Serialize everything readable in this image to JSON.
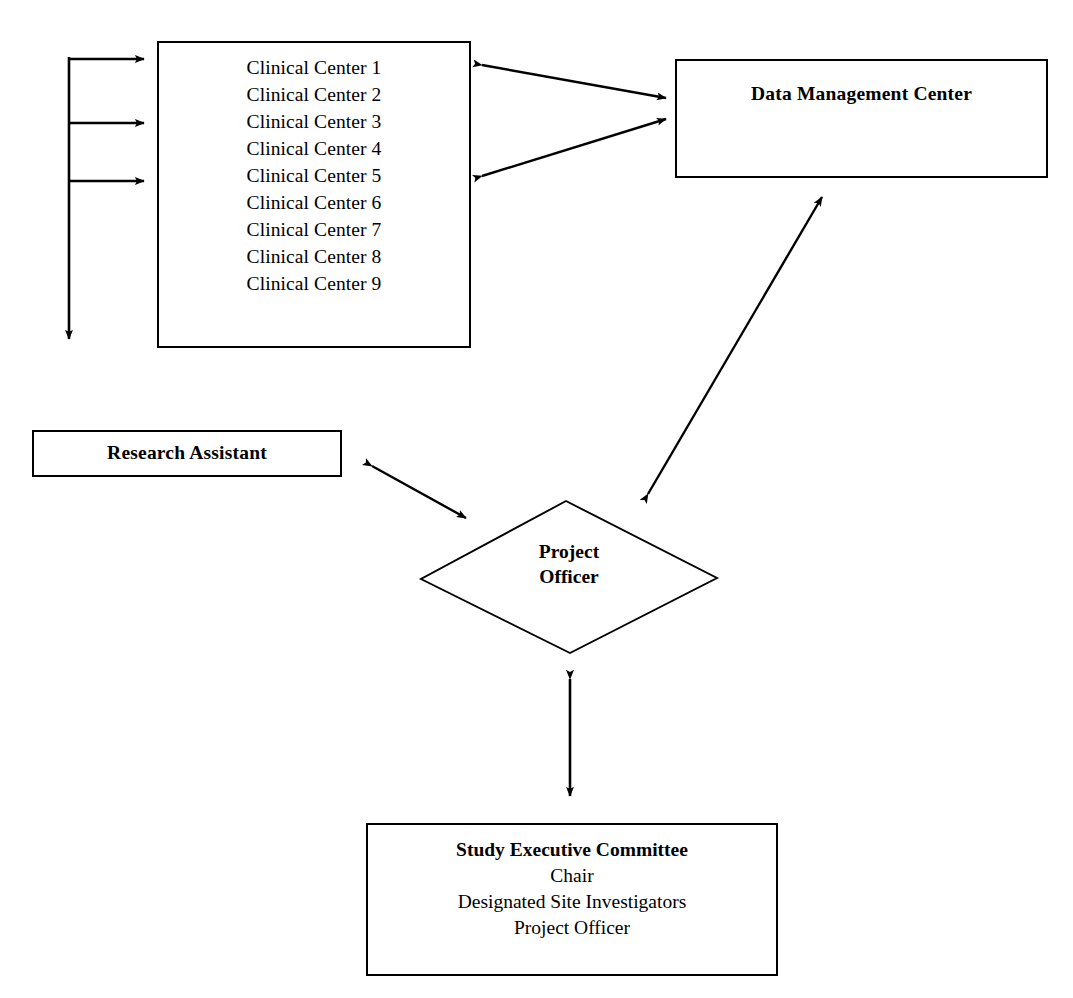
{
  "diagram": {
    "type": "organizational-flow-diagram",
    "line_color": "#000000",
    "background_color": "#ffffff"
  },
  "nodes": {
    "clinical_centers": {
      "shape": "rectangle",
      "items": [
        "Clinical Center 1",
        "Clinical Center 2",
        "Clinical Center 3",
        "Clinical Center 4",
        "Clinical Center 5",
        "Clinical Center 6",
        "Clinical Center 7",
        "Clinical Center 8",
        "Clinical Center 9"
      ]
    },
    "data_management_center": {
      "shape": "rectangle",
      "label": "Data Management Center"
    },
    "research_assistant": {
      "shape": "rectangle",
      "label": "Research Assistant"
    },
    "project_officer": {
      "shape": "diamond",
      "label_line1": "Project",
      "label_line2": "Officer"
    },
    "study_executive_committee": {
      "shape": "rectangle",
      "title": "Study Executive Committee",
      "members": [
        "Chair",
        "Designated Site Investigators",
        "Project Officer"
      ]
    }
  },
  "connectors": [
    {
      "name": "feeder-spine-to-clinical-centers-1",
      "style": "single-arrow",
      "direction": "right"
    },
    {
      "name": "feeder-spine-to-clinical-centers-2",
      "style": "single-arrow",
      "direction": "right"
    },
    {
      "name": "feeder-spine-to-clinical-centers-3",
      "style": "single-arrow",
      "direction": "right"
    },
    {
      "name": "feeder-spine-down",
      "style": "single-arrow",
      "direction": "down"
    },
    {
      "name": "clinical-centers-to-data-management-center-upper",
      "style": "double-arrow",
      "direction": "bidirectional"
    },
    {
      "name": "clinical-centers-to-data-management-center-lower",
      "style": "double-arrow",
      "direction": "bidirectional"
    },
    {
      "name": "project-officer-to-data-management-center",
      "style": "double-arrow",
      "direction": "bidirectional"
    },
    {
      "name": "research-assistant-to-project-officer",
      "style": "double-arrow",
      "direction": "bidirectional"
    },
    {
      "name": "project-officer-to-study-executive-committee",
      "style": "double-arrow",
      "direction": "bidirectional"
    }
  ]
}
